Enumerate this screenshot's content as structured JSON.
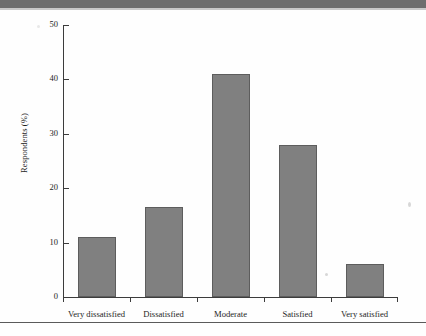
{
  "figure": {
    "ylabel": "Respondents (%)"
  },
  "chart_data": {
    "type": "bar",
    "title": "",
    "xlabel": "",
    "ylabel": "Respondents (%)",
    "categories": [
      "Very dissatisfied",
      "Dissatisfied",
      "Moderate",
      "Satisfied",
      "Very satisfied"
    ],
    "values": [
      11,
      16.5,
      41,
      28,
      6
    ],
    "ylim": [
      0,
      50
    ],
    "yticks": [
      0,
      10,
      20,
      30,
      40,
      50
    ],
    "ytick_labels": [
      "0",
      "10",
      "20",
      "30",
      "40",
      "50"
    ],
    "grid": false,
    "legend": false,
    "bar_color": "#808080",
    "bar_edge_color": "#5d5d5d"
  }
}
